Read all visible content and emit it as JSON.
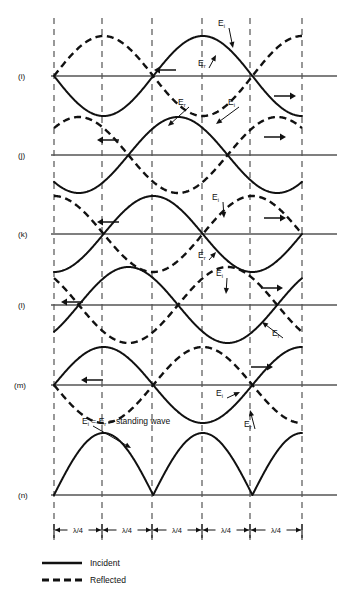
{
  "figure": {
    "background": "#ffffff",
    "ink": "#111111",
    "axis_color": "#555555",
    "width": 341,
    "height": 599
  },
  "gridlines": {
    "x_positions": [
      54,
      102,
      152,
      202,
      250,
      302
    ],
    "top": 18,
    "bottom": 540,
    "style": "dashed",
    "color": "#444444"
  },
  "rows": [
    {
      "id": "i",
      "label": "(i)",
      "label_x": 18,
      "baseline_y": 76,
      "amplitude": 40,
      "incident": {
        "phase_deg": 180,
        "visible": true
      },
      "reflected": {
        "phase_deg": 180,
        "visible": true
      },
      "arrows": [
        {
          "direction": "left",
          "x": 165,
          "y": 70
        },
        {
          "direction": "right",
          "x": 285,
          "y": 96
        }
      ],
      "annotations": [
        {
          "text": "E",
          "sub": "i",
          "x": 218,
          "y": 26,
          "arrow_to_x": 233,
          "arrow_to_y": 48
        },
        {
          "text": "E",
          "sub": "r",
          "x": 198,
          "y": 66,
          "arrow_to_x": 216,
          "arrow_to_y": 55
        }
      ]
    },
    {
      "id": "j",
      "label": "(j)",
      "label_x": 18,
      "baseline_y": 155,
      "amplitude": 38,
      "incident": {
        "phase_deg": 225,
        "visible": true
      },
      "reflected": {
        "phase_deg": 135,
        "visible": true
      },
      "arrows": [
        {
          "direction": "left",
          "x": 108,
          "y": 140
        },
        {
          "direction": "right",
          "x": 275,
          "y": 137
        }
      ],
      "annotations": [
        {
          "text": "E",
          "sub": "r",
          "x": 178,
          "y": 105,
          "arrow_to_x": 168,
          "arrow_to_y": 126
        },
        {
          "text": "E",
          "sub": "i",
          "x": 228,
          "y": 105,
          "arrow_to_x": 216,
          "arrow_to_y": 124
        }
      ]
    },
    {
      "id": "k",
      "label": "(k)",
      "label_x": 18,
      "baseline_y": 234,
      "amplitude": 38,
      "incident": {
        "phase_deg": 270,
        "visible": true
      },
      "reflected": {
        "phase_deg": 90,
        "visible": true
      },
      "arrows": [
        {
          "direction": "left",
          "x": 108,
          "y": 222
        },
        {
          "direction": "right",
          "x": 275,
          "y": 218
        }
      ],
      "annotations": [
        {
          "text": "E",
          "sub": "i",
          "x": 212,
          "y": 200,
          "arrow_to_x": 224,
          "arrow_to_y": 218
        },
        {
          "text": "E",
          "sub": "r",
          "x": 198,
          "y": 258,
          "arrow_to_x": 216,
          "arrow_to_y": 252
        }
      ]
    },
    {
      "id": "l",
      "label": "(l)",
      "label_x": 18,
      "baseline_y": 305,
      "amplitude": 38,
      "incident": {
        "phase_deg": 315,
        "visible": true
      },
      "reflected": {
        "phase_deg": 45,
        "visible": true
      },
      "arrows": [
        {
          "direction": "left",
          "x": 72,
          "y": 302
        },
        {
          "direction": "right",
          "x": 272,
          "y": 288
        }
      ],
      "annotations": [
        {
          "text": "E",
          "sub": "i",
          "x": 216,
          "y": 276,
          "arrow_to_x": 226,
          "arrow_to_y": 294
        },
        {
          "text": "E",
          "sub": "r",
          "x": 272,
          "y": 336,
          "arrow_to_x": 262,
          "arrow_to_y": 322
        }
      ]
    },
    {
      "id": "m",
      "label": "(m)",
      "label_x": 14,
      "baseline_y": 385,
      "amplitude": 38,
      "incident": {
        "phase_deg": 0,
        "visible": true
      },
      "reflected": {
        "phase_deg": 0,
        "visible": true
      },
      "arrows": [
        {
          "direction": "left",
          "x": 92,
          "y": 380
        },
        {
          "direction": "right",
          "x": 262,
          "y": 367
        }
      ],
      "annotations": [
        {
          "text": "E",
          "sub": "i",
          "x": 216,
          "y": 396,
          "arrow_to_x": 240,
          "arrow_to_y": 392
        },
        {
          "text": "E",
          "sub": "r",
          "x": 244,
          "y": 427,
          "arrow_to_x": 250,
          "arrow_to_y": 410
        }
      ]
    },
    {
      "id": "n",
      "label": "(n)",
      "label_x": 18,
      "baseline_y": 495,
      "amplitude": 62,
      "incident": {
        "phase_deg": 0,
        "visible": false
      },
      "reflected": {
        "phase_deg": 0,
        "visible": false
      },
      "standing_wave": true,
      "arrows": [],
      "annotations": [
        {
          "text": "E",
          "sub": "i",
          "suffix": " = E",
          "sub2": "r",
          "suffix2": " = standing wave",
          "x": 82,
          "y": 424,
          "arrow_to_x": 131,
          "arrow_to_y": 448
        }
      ]
    }
  ],
  "scale_bar": {
    "y": 530,
    "tick_top": 524,
    "tick_bottom": 538,
    "segments": [
      {
        "label": "λ/4",
        "from": 54,
        "to": 102
      },
      {
        "label": "λ/4",
        "from": 102,
        "to": 152
      },
      {
        "label": "λ/4",
        "from": 152,
        "to": 202
      },
      {
        "label": "λ/4",
        "from": 202,
        "to": 250
      },
      {
        "label": "λ/4",
        "from": 250,
        "to": 302
      }
    ]
  },
  "legend": {
    "x_line_start": 42,
    "x_line_end": 82,
    "x_text": 90,
    "items": [
      {
        "label": "Incident",
        "style": "solid",
        "y": 566
      },
      {
        "label": "Reflected",
        "style": "dashed",
        "y": 583
      }
    ]
  }
}
